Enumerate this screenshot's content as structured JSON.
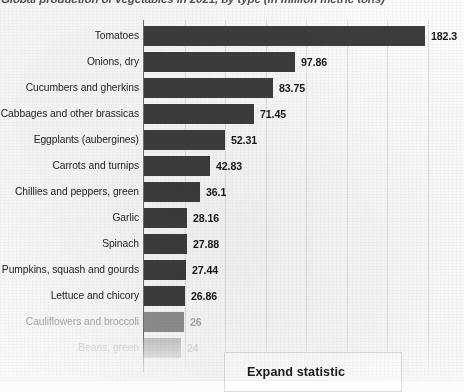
{
  "title": "Global production of vegetables in 2021, by type (in million metric tons)",
  "button": {
    "expand_label": "Expand statistic"
  },
  "chart_data": {
    "type": "bar",
    "orientation": "horizontal",
    "title": "Global production of vegetables in 2021, by type (in million metric tons)",
    "xlabel": "",
    "ylabel": "",
    "unit": "million metric tons",
    "grid": true,
    "legend": "none",
    "xlim": [
      0,
      200
    ],
    "categories": [
      "Tomatoes",
      "Onions, dry",
      "Cucumbers and gherkins",
      "Cabbages and other brassicas",
      "Eggplants (aubergines)",
      "Carrots and turnips",
      "Chillies and peppers, green",
      "Garlic",
      "Spinach",
      "Pumpkins, squash and gourds",
      "Lettuce and chicory",
      "Cauliflowers and broccoli",
      "Beans, green"
    ],
    "values": [
      182.3,
      97.86,
      83.75,
      71.45,
      52.31,
      42.83,
      36.1,
      28.16,
      27.88,
      27.44,
      26.86,
      26,
      24
    ],
    "value_labels": [
      "182.3",
      "97.86",
      "83.75",
      "71.45",
      "52.31",
      "42.83",
      "36.1",
      "28.16",
      "27.88",
      "27.44",
      "26.86",
      "26",
      "24"
    ],
    "fade_levels": [
      0,
      0,
      0,
      0,
      0,
      0,
      0,
      0,
      0,
      0,
      0,
      1,
      2
    ],
    "bar_color": "#3d3d3d",
    "bar_color_faded_1": "#8f8f8f",
    "bar_color_faded_2": "#c2c2c0",
    "background_color": "#fbfbfa",
    "gridline_color": "#d8d8d6",
    "axis_color": "#6f6f6f",
    "label_color": "#232323",
    "value_color": "#171717"
  }
}
